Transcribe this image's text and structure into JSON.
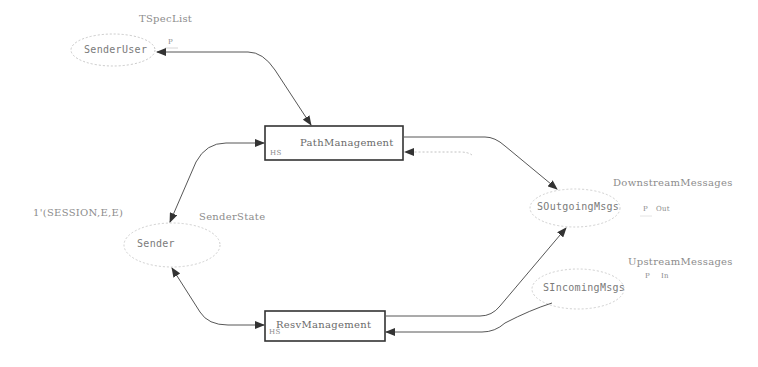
{
  "diagram": {
    "type": "colored-petri-net-page",
    "places": [
      {
        "id": "sender-user",
        "name": "SenderUser",
        "colorset": "TSpecList",
        "port": "P",
        "port_type": ""
      },
      {
        "id": "sender",
        "name": "Sender",
        "colorset": "SenderState",
        "initial_marking": "1'(SESSION,E,E)"
      },
      {
        "id": "s-outgoing-msgs",
        "name": "SOutgoingMsgs",
        "colorset": "DownstreamMessages",
        "port": "P",
        "port_type": "Out"
      },
      {
        "id": "s-incoming-msgs",
        "name": "SIncomingMsgs",
        "colorset": "UpstreamMessages",
        "port": "P",
        "port_type": "In"
      }
    ],
    "transitions": [
      {
        "id": "path-management",
        "name": "PathManagement",
        "tag": "HS"
      },
      {
        "id": "resv-management",
        "name": "ResvManagement",
        "tag": "HS"
      }
    ],
    "arcs": [
      {
        "from": "path-management",
        "to": "sender-user",
        "bidirectional": true
      },
      {
        "from": "sender",
        "to": "path-management",
        "bidirectional": true
      },
      {
        "from": "path-management",
        "to": "s-outgoing-msgs"
      },
      {
        "from": "s-outgoing-msgs",
        "to": "path-management"
      },
      {
        "from": "sender",
        "to": "resv-management",
        "bidirectional": true
      },
      {
        "from": "resv-management",
        "to": "s-outgoing-msgs"
      },
      {
        "from": "s-incoming-msgs",
        "to": "resv-management"
      }
    ]
  }
}
